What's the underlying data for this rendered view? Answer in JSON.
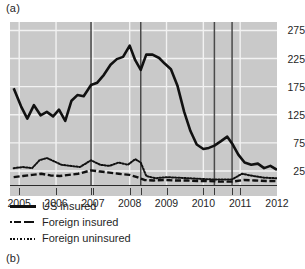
{
  "figure": {
    "panel_a_label": "(a)",
    "panel_b_label": "(b)"
  },
  "chart_data": {
    "type": "line",
    "title": "",
    "xlabel": "",
    "ylabel": "",
    "xlim": [
      2004.75,
      2012.0
    ],
    "ylim": [
      0,
      290
    ],
    "yticks": [
      25,
      75,
      125,
      175,
      225,
      275
    ],
    "ytick_labels": [
      "25",
      "75",
      "125",
      "175",
      "225",
      "275"
    ],
    "xticks": [
      2005,
      2006,
      2007,
      2008,
      2009,
      2010,
      2011,
      2012
    ],
    "xtick_labels": [
      "2005",
      "2006",
      "2007",
      "2008",
      "2009",
      "2010",
      "2011",
      "2012"
    ],
    "grid": true,
    "grid_color": "#f2f2f2",
    "plot_background": "#c9c9c9",
    "legend_position": "below-axes",
    "event_lines": [
      2006.95,
      2008.3,
      2010.3,
      2010.78
    ],
    "series": [
      {
        "name": "US insured",
        "style": "solid",
        "color": "#111111",
        "x": [
          2004.85,
          2005.05,
          2005.22,
          2005.4,
          2005.58,
          2005.75,
          2005.92,
          2006.08,
          2006.25,
          2006.42,
          2006.58,
          2006.75,
          2006.95,
          2007.12,
          2007.3,
          2007.48,
          2007.65,
          2007.82,
          2008.0,
          2008.15,
          2008.3,
          2008.45,
          2008.62,
          2008.8,
          2008.95,
          2009.12,
          2009.3,
          2009.48,
          2009.65,
          2009.82,
          2010.0,
          2010.15,
          2010.3,
          2010.48,
          2010.65,
          2010.78,
          2010.95,
          2011.12,
          2011.3,
          2011.48,
          2011.65,
          2011.82,
          2012.0
        ],
        "values": [
          172,
          140,
          118,
          142,
          124,
          130,
          122,
          134,
          114,
          150,
          160,
          158,
          178,
          182,
          196,
          214,
          224,
          228,
          248,
          222,
          205,
          232,
          232,
          226,
          216,
          206,
          176,
          130,
          96,
          72,
          64,
          66,
          70,
          78,
          86,
          74,
          54,
          40,
          36,
          38,
          30,
          34,
          27
        ]
      },
      {
        "name": "Foreign insured",
        "style": "dashed",
        "color": "#111111",
        "x": [
          2004.85,
          2005.1,
          2005.35,
          2005.6,
          2005.85,
          2006.1,
          2006.35,
          2006.6,
          2006.95,
          2007.2,
          2007.45,
          2007.7,
          2008.0,
          2008.2,
          2008.4,
          2008.65,
          2008.95,
          2009.25,
          2009.55,
          2009.85,
          2010.15,
          2010.45,
          2010.78,
          2011.1,
          2011.4,
          2011.7,
          2012.0
        ],
        "values": [
          14,
          16,
          18,
          20,
          17,
          16,
          18,
          20,
          26,
          24,
          22,
          20,
          18,
          14,
          9,
          8,
          9,
          8,
          8,
          7,
          7,
          6,
          6,
          9,
          8,
          7,
          7
        ]
      },
      {
        "name": "Foreign uninsured",
        "style": "dotted",
        "color": "#111111",
        "x": [
          2004.85,
          2005.1,
          2005.35,
          2005.55,
          2005.75,
          2005.95,
          2006.15,
          2006.4,
          2006.65,
          2006.95,
          2007.2,
          2007.45,
          2007.7,
          2007.95,
          2008.15,
          2008.3,
          2008.45,
          2008.7,
          2009.0,
          2009.3,
          2009.6,
          2009.9,
          2010.2,
          2010.5,
          2010.78,
          2011.05,
          2011.35,
          2011.65,
          2012.0
        ],
        "values": [
          30,
          32,
          30,
          44,
          48,
          42,
          36,
          34,
          32,
          44,
          36,
          34,
          40,
          36,
          46,
          40,
          16,
          12,
          14,
          13,
          12,
          11,
          10,
          10,
          10,
          20,
          16,
          13,
          12
        ]
      }
    ]
  },
  "legend": {
    "items": [
      {
        "label": "US insured",
        "style": "solid"
      },
      {
        "label": "Foreign insured",
        "style": "dashed"
      },
      {
        "label": "Foreign uninsured",
        "style": "dotted"
      }
    ]
  }
}
